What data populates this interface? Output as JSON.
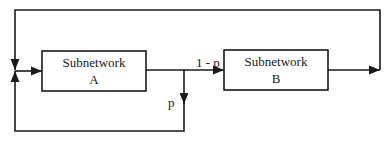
{
  "diagram": {
    "type": "block-diagram",
    "nodes": [
      {
        "id": "A",
        "title": "Subnetwork",
        "letter": "A"
      },
      {
        "id": "B",
        "title": "Subnetwork",
        "letter": "B"
      }
    ],
    "edges": [
      {
        "from": "junction",
        "to": "A",
        "label": ""
      },
      {
        "from": "A",
        "to": "B",
        "label": "1 - p"
      },
      {
        "from": "A",
        "to": "junction",
        "label": "p",
        "route": "feedback-bottom"
      },
      {
        "from": "B",
        "to": "junction",
        "label": "",
        "route": "feedback-top"
      }
    ],
    "labels": {
      "one_minus_p": "1 - p",
      "p": "p"
    },
    "colors": {
      "stroke": "#1a1a1a",
      "background": "#ffffff"
    }
  }
}
